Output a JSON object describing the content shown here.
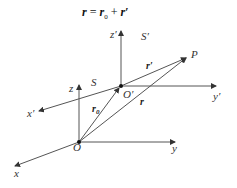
{
  "equation": {
    "lhs": "r",
    "eq": " = ",
    "term1": "r",
    "term1_sub": "0",
    "plus": " + ",
    "term2": "r′"
  },
  "frame_S": {
    "label": "S",
    "origin": "O",
    "axes": {
      "x": "x",
      "y": "y",
      "z": "z"
    }
  },
  "frame_S_prime": {
    "label": "S′",
    "origin": "O′",
    "axes": {
      "x": "x′",
      "y": "y′",
      "z": "z′"
    }
  },
  "point": "P",
  "vectors": {
    "r0": "r",
    "r0_sub": "0",
    "r": "r",
    "r_prime": "r′"
  }
}
